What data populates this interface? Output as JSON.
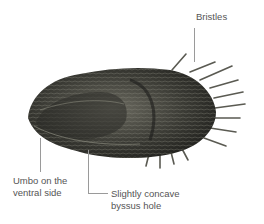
{
  "labels": {
    "bristles": "Bristles",
    "umbo_line1": "Umbo on the",
    "umbo_line2": "ventral side",
    "byssus_line1": "Slightly concave",
    "byssus_line2": "byssus hole"
  },
  "colors": {
    "shell_dark": "#2a2a26",
    "shell_mid": "#5a5a50",
    "shell_light": "#8a8a7e",
    "text": "#555555",
    "leader": "#9a9a9a"
  }
}
